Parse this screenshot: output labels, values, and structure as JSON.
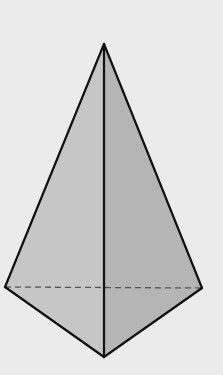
{
  "diagram": {
    "type": "pyramid",
    "background_color": "#ebebeb",
    "stroke_color": "#111111",
    "hidden_edge_color": "#555555",
    "vertices": {
      "apex": [
        104,
        44
      ],
      "left": [
        5,
        287
      ],
      "right": [
        202,
        288
      ],
      "front": [
        104,
        357
      ]
    },
    "faces": [
      {
        "name": "left-face",
        "points": [
          "apex",
          "left",
          "front"
        ],
        "fill": "#c6c6c6"
      },
      {
        "name": "right-face",
        "points": [
          "apex",
          "front",
          "right"
        ],
        "fill": "#b5b5b5"
      }
    ],
    "edges": [
      {
        "name": "apex-left",
        "from": "apex",
        "to": "left",
        "style": "solid"
      },
      {
        "name": "apex-right",
        "from": "apex",
        "to": "right",
        "style": "solid"
      },
      {
        "name": "apex-front",
        "from": "apex",
        "to": "front",
        "style": "solid"
      },
      {
        "name": "left-front",
        "from": "left",
        "to": "front",
        "style": "solid"
      },
      {
        "name": "front-right",
        "from": "front",
        "to": "right",
        "style": "solid"
      },
      {
        "name": "left-right",
        "from": "left",
        "to": "right",
        "style": "dashed"
      }
    ]
  }
}
